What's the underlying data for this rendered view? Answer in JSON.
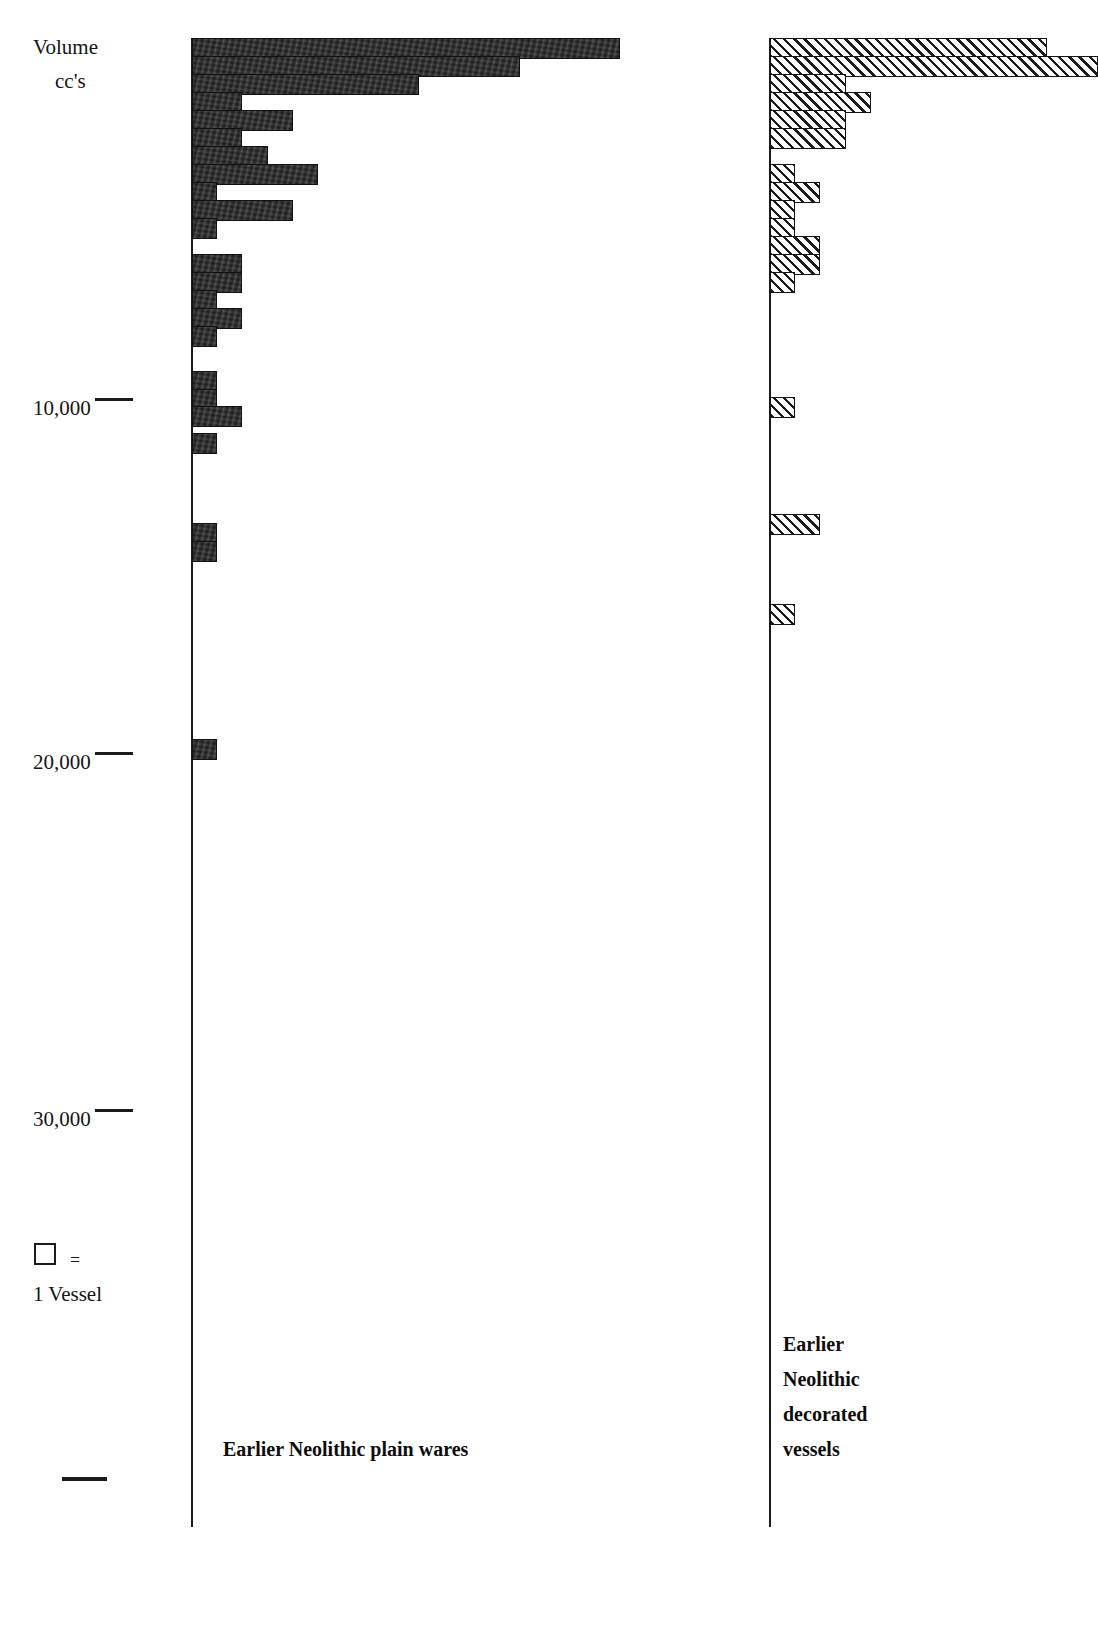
{
  "figure": {
    "axis_title": {
      "line1": "Volume",
      "line2": "cc's"
    },
    "legend": {
      "swatch": "open-square",
      "equals": "=",
      "text": "1 Vessel"
    },
    "captions": {
      "left": "Earlier Neolithic plain wares",
      "right_line1": "Earlier",
      "right_line2": "Neolithic",
      "right_line3": "decorated",
      "right_line4": "vessels"
    },
    "tick_labels": [
      "10,000",
      "20,000",
      "30,000"
    ],
    "colors": {
      "ink": "#1b1b1b",
      "solid_bar_fill": "#2b2b2b",
      "hatch_bar_fill": "#ffffff",
      "background": "#ffffff"
    }
  },
  "chart_data": {
    "type": "bar",
    "orientation": "horizontal",
    "xlabel": "Number of vessels (1 square = 1 vessel)",
    "ylabel": "Volume cc's",
    "ylim": [
      0,
      37000
    ],
    "y_inverted": true,
    "ytick_values": [
      10000,
      20000,
      30000
    ],
    "ytick_labels": [
      "10,000",
      "20,000",
      "30,000"
    ],
    "grid": false,
    "legend": "1 Vessel = 1 square",
    "bin_width_cc": 500,
    "series": [
      {
        "name": "Earlier Neolithic plain wares",
        "style": "solid",
        "bins_cc": [
          250,
          750,
          1250,
          1750,
          2250,
          2750,
          3250,
          3750,
          4250,
          4750,
          5250,
          6250,
          6750,
          7250,
          7750,
          8250,
          9500,
          10000,
          10500,
          11250,
          13750,
          14250,
          19750
        ],
        "counts": [
          17,
          13,
          9,
          2,
          4,
          2,
          3,
          5,
          1,
          4,
          1,
          2,
          2,
          1,
          2,
          1,
          1,
          1,
          2,
          1,
          1,
          1,
          1
        ]
      },
      {
        "name": "Earlier Neolithic decorated vessels",
        "style": "hatched",
        "bins_cc": [
          250,
          750,
          1250,
          1750,
          2250,
          2750,
          3750,
          4250,
          4750,
          5250,
          5750,
          6250,
          6750,
          10250,
          13500,
          16000
        ],
        "counts": [
          11,
          13,
          3,
          4,
          3,
          3,
          1,
          2,
          1,
          1,
          2,
          2,
          1,
          1,
          2,
          1
        ]
      }
    ]
  }
}
